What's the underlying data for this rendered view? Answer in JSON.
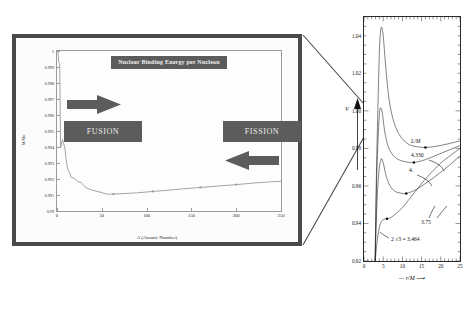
{
  "figure": {
    "background_color": "#ffffff",
    "panel_border_color": "#4a4a4a",
    "accent_gray": "#5c5c5c"
  },
  "left_panel": {
    "title": "Nuclear Binding Energy per Nucleon",
    "fusion_label": "FUSION",
    "fission_label": "FISSION",
    "arrow_right_name": "fusion-direction-arrow",
    "arrow_left_name": "fission-direction-arrow",
    "chart_data": {
      "type": "line",
      "title": "Nuclear Binding Energy per Nucleon",
      "xlabel": "A (Atomic Number)",
      "ylabel": "M/Mo",
      "xlim": [
        0,
        250
      ],
      "ylim": [
        0.99,
        1.0
      ],
      "xticks": [
        0,
        50,
        100,
        150,
        200,
        250
      ],
      "yticks": [
        "0.99",
        "0.991",
        "0.992",
        "0.993",
        "0.994",
        "0.995",
        "0.996",
        "0.997",
        "0.998",
        "0.999",
        "1"
      ],
      "grid": false,
      "legend": false,
      "x": [
        1,
        2,
        3,
        4,
        6,
        7,
        9,
        10,
        12,
        14,
        16,
        19,
        23,
        27,
        32,
        40,
        48,
        56,
        63,
        75,
        90,
        107,
        120,
        140,
        160,
        180,
        200,
        220,
        238,
        250
      ],
      "values": [
        1.0,
        0.99926,
        0.99921,
        0.99395,
        0.99446,
        0.99432,
        0.99387,
        0.99325,
        0.99261,
        0.99241,
        0.99209,
        0.99206,
        0.99185,
        0.99178,
        0.99146,
        0.99129,
        0.99118,
        0.99105,
        0.99106,
        0.99109,
        0.99114,
        0.99122,
        0.99128,
        0.99138,
        0.99147,
        0.99156,
        0.99165,
        0.99175,
        0.99182,
        0.99186
      ]
    }
  },
  "right_panel": {
    "chart_data": {
      "type": "line",
      "title": "",
      "xlabel": "r/M",
      "ylabel": "V",
      "xlim": [
        0,
        25
      ],
      "ylim": [
        0.92,
        1.05
      ],
      "xticks": [
        0,
        5,
        10,
        15,
        20,
        25
      ],
      "yticks": [
        "0.92",
        "0.94",
        "0.96",
        "0.98",
        "1.00",
        "1.02",
        "1.04"
      ],
      "grid": false,
      "legend_position": "inline-annotations",
      "series": [
        {
          "name": "4.330",
          "label": "4.330",
          "peak_x": 4.6,
          "peak_y": 1.0445,
          "min_x": 16.0,
          "min_y": 0.9805,
          "x": [
            2.9,
            3.2,
            3.6,
            4.0,
            4.3,
            4.6,
            5.0,
            5.6,
            6.4,
            7.5,
            9.0,
            11.0,
            13.0,
            16.0,
            19.0,
            22.0,
            25.0
          ],
          "y": [
            0.92,
            0.962,
            1.0,
            1.031,
            1.042,
            1.0445,
            1.04,
            1.025,
            1.008,
            0.996,
            0.988,
            0.983,
            0.9812,
            0.9805,
            0.9812,
            0.9825,
            0.984
          ]
        },
        {
          "name": "4.",
          "label": "4.",
          "peak_x": 4.4,
          "peak_y": 1.0015,
          "min_x": 13.0,
          "min_y": 0.9725,
          "x": [
            2.9,
            3.3,
            3.8,
            4.1,
            4.4,
            4.8,
            5.4,
            6.3,
            7.5,
            9.0,
            11.0,
            13.0,
            16.0,
            19.0,
            22.0,
            25.0
          ],
          "y": [
            0.92,
            0.964,
            0.991,
            1.0,
            1.0015,
            0.9985,
            0.989,
            0.981,
            0.9765,
            0.974,
            0.9728,
            0.9725,
            0.974,
            0.9765,
            0.979,
            0.9815
          ]
        },
        {
          "name": "3.75",
          "label": "3.75",
          "peak_x": 4.6,
          "peak_y": 0.9745,
          "min_x": 11.0,
          "min_y": 0.956,
          "x": [
            2.9,
            3.4,
            3.9,
            4.3,
            4.6,
            5.1,
            5.8,
            6.8,
            8.0,
            9.5,
            11.0,
            13.5,
            16.5,
            19.5,
            22.5,
            25.0
          ],
          "y": [
            0.92,
            0.952,
            0.968,
            0.973,
            0.9745,
            0.9715,
            0.965,
            0.96,
            0.9572,
            0.9562,
            0.956,
            0.958,
            0.962,
            0.9665,
            0.9715,
            0.976
          ]
        },
        {
          "name": "2 sqrt3 = 3.464",
          "label": "2 √3 = 3.464",
          "inflection_x": 6.0,
          "inflection_y": 0.9425,
          "x": [
            2.9,
            3.4,
            4.0,
            4.6,
            5.2,
            6.0,
            7.0,
            8.5,
            10.0,
            12.0,
            14.5,
            17.0,
            20.0,
            22.5,
            25.0
          ],
          "y": [
            0.92,
            0.93,
            0.938,
            0.9412,
            0.9422,
            0.9425,
            0.9432,
            0.9455,
            0.9485,
            0.9535,
            0.96,
            0.966,
            0.9722,
            0.9762,
            0.98
          ]
        }
      ],
      "annotations": [
        {
          "text": "L/M",
          "x": 16.0,
          "y": 0.9925
        },
        {
          "text": "4.330",
          "x": 15.5,
          "y": 0.9865
        },
        {
          "text": "4.",
          "x": 14.5,
          "y": 0.9795
        },
        {
          "text": "3.75",
          "x": 17.5,
          "y": 0.948
        },
        {
          "text": "2 √3 = 3.464",
          "x": 10.5,
          "y": 0.9405
        }
      ]
    }
  }
}
